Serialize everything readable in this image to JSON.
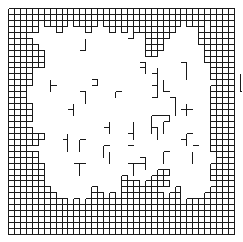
{
  "diagram": {
    "type": "percolation-grid",
    "rows": 38,
    "cols": 38,
    "line_color": "#1a1a1a",
    "background_color": "#ffffff",
    "fill_map": [
      "######################################",
      "######################################",
      "#####.####.##.#.#.#####.###.#.###.####",
      "#####...#....#...#.#.#######....#.####",
      "###....................####.....##.###",
      "####...................###......#######",
      "#####..................###.......#####",
      "######.................#.........#####",
      "######...........................#####",
      "######............................####",
      "####..............................####",
      "####..............................####",
      "####...............................###",
      "###...............................####",
      "###...............................####",
      "###...............................####",
      "####..............................####",
      "####..............................####",
      "####..............................####",
      "###...............................####",
      "####..............................####",
      "######............................####",
      "#####.............................####",
      "###...............................####",
      "#####..............................###",
      "#####..............................###",
      "######............................####",
      "######...................##.......####",
      "######.............#....##........####",
      "######.............###.####........###",
      "#######.......#....######...#.....####",
      "########......##.#.#######.##....#####",
      "##########.#.##########.#####.########",
      "######################################",
      "######################################",
      "######################################",
      "######################################",
      "######################################"
    ],
    "stray_segments": [
      [
        [
          21,
          4
        ],
        [
          22,
          4
        ]
      ],
      [
        [
          21,
          4
        ],
        [
          21,
          5
        ]
      ],
      [
        [
          20,
          5
        ],
        [
          21,
          5
        ]
      ],
      [
        [
          36,
          5
        ],
        [
          36,
          6
        ]
      ],
      [
        [
          36,
          6
        ],
        [
          37,
          6
        ]
      ],
      [
        [
          42,
          3
        ],
        [
          42,
          5
        ]
      ],
      [
        [
          42,
          4
        ],
        [
          43,
          4
        ]
      ],
      [
        [
          22,
          9
        ],
        [
          23,
          9
        ]
      ],
      [
        [
          23,
          8
        ],
        [
          23,
          9
        ]
      ],
      [
        [
          44,
          12
        ],
        [
          45,
          12
        ]
      ],
      [
        [
          44,
          12
        ],
        [
          44,
          14
        ]
      ],
      [
        [
          44,
          14
        ],
        [
          45,
          14
        ]
      ],
      [
        [
          44,
          15
        ],
        [
          45,
          15
        ]
      ],
      [
        [
          54,
          13
        ],
        [
          55,
          13
        ]
      ],
      [
        [
          54,
          13
        ],
        [
          54,
          15
        ]
      ],
      [
        [
          83,
          14
        ],
        [
          84,
          14
        ]
      ],
      [
        [
          84,
          13
        ],
        [
          84,
          15
        ]
      ],
      [
        [
          86,
          13
        ],
        [
          86,
          16
        ]
      ],
      [
        [
          86,
          16
        ],
        [
          87,
          16
        ]
      ],
      [
        [
          64,
          12
        ],
        [
          64,
          17
        ]
      ],
      [
        [
          64,
          14
        ],
        [
          65,
          14
        ]
      ],
      [
        [
          74,
          11
        ],
        [
          74,
          16
        ]
      ],
      [
        [
          74,
          16
        ],
        [
          75,
          16
        ]
      ]
    ],
    "tree_segments": [
      [
        [
          13,
          5
        ],
        [
          13,
          7
        ]
      ],
      [
        [
          13,
          7
        ],
        [
          12,
          7
        ]
      ],
      [
        [
          14,
          12
        ],
        [
          15,
          12
        ]
      ],
      [
        [
          15,
          12
        ],
        [
          15,
          13
        ]
      ],
      [
        [
          14,
          13
        ],
        [
          15,
          13
        ]
      ],
      [
        [
          21,
          3
        ],
        [
          21,
          5
        ]
      ],
      [
        [
          20,
          5
        ],
        [
          21,
          5
        ]
      ],
      [
        [
          25,
          6
        ],
        [
          25,
          8
        ]
      ],
      [
        [
          24,
          7
        ],
        [
          25,
          7
        ]
      ],
      [
        [
          24,
          8
        ],
        [
          25,
          8
        ]
      ],
      [
        [
          36,
          4
        ],
        [
          36,
          6
        ]
      ],
      [
        [
          36,
          6
        ],
        [
          37,
          6
        ]
      ],
      [
        [
          22,
          9
        ],
        [
          23,
          9
        ]
      ],
      [
        [
          23,
          9
        ],
        [
          23,
          11
        ]
      ],
      [
        [
          22,
          10
        ],
        [
          23,
          10
        ]
      ],
      [
        [
          25,
          10
        ],
        [
          25,
          15
        ]
      ],
      [
        [
          24,
          11
        ],
        [
          25,
          11
        ]
      ],
      [
        [
          24,
          13
        ],
        [
          25,
          13
        ]
      ],
      [
        [
          24,
          15
        ],
        [
          25,
          15
        ]
      ],
      [
        [
          26,
          12
        ],
        [
          26,
          14
        ]
      ],
      [
        [
          26,
          14
        ],
        [
          27,
          14
        ]
      ],
      [
        [
          29,
          9
        ],
        [
          30,
          9
        ]
      ],
      [
        [
          30,
          9
        ],
        [
          30,
          12
        ]
      ],
      [
        [
          27,
          15
        ],
        [
          28,
          15
        ]
      ],
      [
        [
          28,
          15
        ],
        [
          28,
          18
        ]
      ],
      [
        [
          39,
          11
        ],
        [
          39,
          14
        ]
      ],
      [
        [
          39,
          14
        ],
        [
          40,
          14
        ]
      ],
      [
        [
          38,
          9
        ],
        [
          38,
          10
        ]
      ],
      [
        [
          7,
          13
        ],
        [
          8,
          13
        ]
      ],
      [
        [
          7,
          12
        ],
        [
          7,
          14
        ]
      ],
      [
        [
          10,
          17
        ],
        [
          11,
          17
        ]
      ],
      [
        [
          11,
          16
        ],
        [
          11,
          18
        ]
      ],
      [
        [
          12,
          14
        ],
        [
          13,
          14
        ]
      ],
      [
        [
          13,
          14
        ],
        [
          13,
          16
        ]
      ],
      [
        [
          18,
          14
        ],
        [
          19,
          14
        ]
      ],
      [
        [
          18,
          14
        ],
        [
          18,
          15
        ]
      ],
      [
        [
          16,
          20
        ],
        [
          17,
          20
        ]
      ],
      [
        [
          17,
          19
        ],
        [
          17,
          21
        ]
      ],
      [
        [
          12,
          22
        ],
        [
          12,
          24
        ]
      ],
      [
        [
          12,
          22
        ],
        [
          13,
          22
        ]
      ],
      [
        [
          16,
          23
        ],
        [
          17,
          23
        ]
      ],
      [
        [
          16,
          23
        ],
        [
          16,
          25
        ]
      ],
      [
        [
          17,
          24
        ],
        [
          17,
          26
        ]
      ],
      [
        [
          20,
          21
        ],
        [
          21,
          21
        ]
      ],
      [
        [
          21,
          19
        ],
        [
          21,
          22
        ]
      ],
      [
        [
          20,
          23
        ],
        [
          21,
          23
        ]
      ],
      [
        [
          24,
          18
        ],
        [
          27,
          18
        ]
      ],
      [
        [
          24,
          18
        ],
        [
          24,
          21
        ]
      ],
      [
        [
          24,
          20
        ],
        [
          25,
          20
        ]
      ],
      [
        [
          25,
          20
        ],
        [
          25,
          22
        ]
      ],
      [
        [
          27,
          18
        ],
        [
          27,
          19
        ]
      ],
      [
        [
          26,
          19
        ],
        [
          27,
          19
        ]
      ],
      [
        [
          26,
          19
        ],
        [
          26,
          21
        ]
      ],
      [
        [
          30,
          16
        ],
        [
          30,
          18
        ]
      ],
      [
        [
          29,
          17
        ],
        [
          31,
          17
        ]
      ],
      [
        [
          30,
          21
        ],
        [
          31,
          21
        ]
      ],
      [
        [
          30,
          21
        ],
        [
          30,
          23
        ]
      ],
      [
        [
          29,
          22
        ],
        [
          30,
          22
        ]
      ],
      [
        [
          31,
          23
        ],
        [
          32,
          23
        ]
      ],
      [
        [
          31,
          24
        ],
        [
          31,
          26
        ]
      ],
      [
        [
          23,
          25
        ],
        [
          23,
          27
        ]
      ],
      [
        [
          22,
          25
        ],
        [
          23,
          25
        ]
      ],
      [
        [
          22,
          26
        ],
        [
          23,
          26
        ]
      ],
      [
        [
          26,
          24
        ],
        [
          27,
          24
        ]
      ],
      [
        [
          26,
          24
        ],
        [
          26,
          26
        ]
      ],
      [
        [
          20,
          26
        ],
        [
          22,
          26
        ]
      ],
      [
        [
          21,
          26
        ],
        [
          21,
          28
        ]
      ],
      [
        [
          9,
          22
        ],
        [
          10,
          22
        ]
      ],
      [
        [
          10,
          21
        ],
        [
          10,
          24
        ]
      ],
      [
        [
          11,
          26
        ],
        [
          13,
          26
        ]
      ],
      [
        [
          12,
          26
        ],
        [
          12,
          28
        ]
      ]
    ]
  }
}
